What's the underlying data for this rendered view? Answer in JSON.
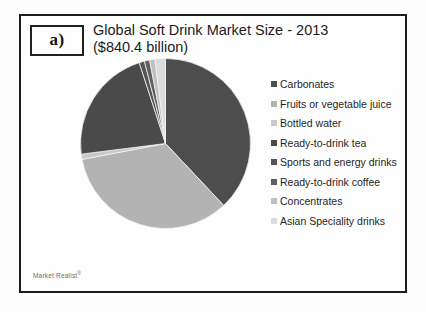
{
  "figure": {
    "panel_label": "a)",
    "title_line1": "Global Soft Drink Market Size - 2013",
    "title_line2": "($840.4 billion)",
    "watermark": "Market Realist",
    "watermark_mark": "®",
    "faint_footer": ""
  },
  "chart_data": {
    "type": "pie",
    "title": "Global Soft Drink Market Size - 2013 ($840.4 billion)",
    "subtitle": "($840.4 billion)",
    "total_label": "$840.4 billion",
    "legend_position": "right",
    "grid": false,
    "categories": [
      "Carbonates",
      "Fruits or vegetable juice",
      "Bottled water",
      "Ready-to-drink tea",
      "Sports and energy drinks",
      "Ready-to-drink coffee",
      "Concentrates",
      "Asian Speciality drinks"
    ],
    "values": [
      38,
      34,
      1,
      22,
      1,
      1,
      1,
      2
    ],
    "colors": [
      "#4d4d4d",
      "#b3b3b3",
      "#c9c9c9",
      "#4a4a4a",
      "#555555",
      "#5f5f5f",
      "#c0c0c0",
      "#dcdcdc"
    ],
    "legend_entries": [
      {
        "label": "Carbonates",
        "color": "#4d4d4d",
        "value": 38
      },
      {
        "label": "Fruits or vegetable juice",
        "color": "#b3b3b3",
        "value": 34
      },
      {
        "label": "Bottled water",
        "color": "#c9c9c9",
        "value": 1
      },
      {
        "label": "Ready-to-drink tea",
        "color": "#4a4a4a",
        "value": 22
      },
      {
        "label": "Sports and energy drinks",
        "color": "#555555",
        "value": 1
      },
      {
        "label": "Ready-to-drink coffee",
        "color": "#5f5f5f",
        "value": 1
      },
      {
        "label": "Concentrates",
        "color": "#c0c0c0",
        "value": 1
      },
      {
        "label": "Asian Speciality drinks",
        "color": "#dcdcdc",
        "value": 2
      }
    ],
    "xlabel": "",
    "ylabel": ""
  }
}
